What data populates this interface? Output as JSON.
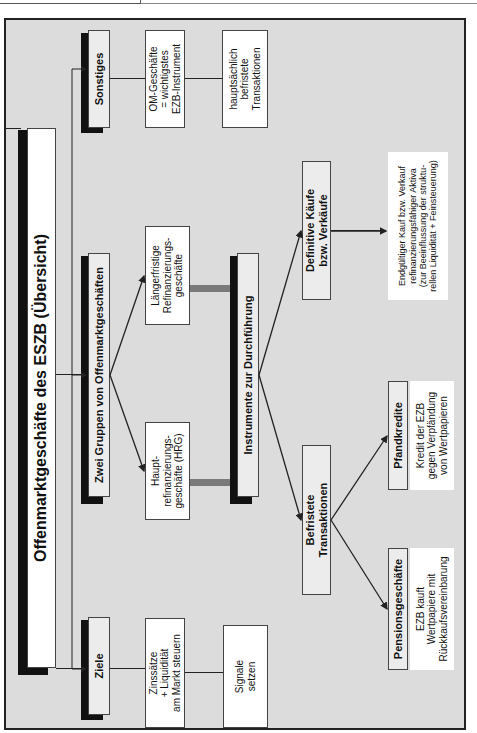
{
  "title": "Offenmarktgeschäfte des ESZB (Übersicht)",
  "left_branch": {
    "header": "Ziele",
    "items": [
      "Zinssätze\n+ Liquidität\nam Markt steuern",
      "Signale\nsetzen"
    ]
  },
  "center_branch": {
    "header": "Zwei Gruppen von Offenmarktgeschäften",
    "groups": [
      "Haupt-\nrefinanzierungs-\ngeschäfte (HRG)",
      "Längerfristige\nRefinanzierungs-\ngeschäfte"
    ],
    "instruments_header": "Instrumente zur Durchführung",
    "befristete": {
      "header": "Befristete\nTransaktionen",
      "children": [
        {
          "header": "Pensionsgeschäfte",
          "desc": "EZB kauft\nWertpapiere mit\nRückkaufsvereinbarung"
        },
        {
          "header": "Pfandkredite",
          "desc": "Kredit der EZB\ngegen Verpfändung\nvon Wertpapieren"
        }
      ]
    },
    "definitive": {
      "header": "Definitive Käufe\nbzw. Verkäufe",
      "desc": "Endgültiger Kauf bzw. Verkauf\nrefinanzierungsfähiger Aktiva\n(zur Beeinflussung der struktu-\nrellen Liquidität + Feinsteuerung)"
    }
  },
  "right_branch": {
    "header": "Sonstiges",
    "items": [
      "OM-Geschäfte\n= wichtigstes\nEZB-Instrument",
      "hauptsächlich\nbefristete\nTransaktionen"
    ]
  },
  "colors": {
    "background": "#dcdcdc",
    "box": "#ffffff",
    "shadow": "#111111",
    "connector_gray": "#7a7a7a"
  }
}
